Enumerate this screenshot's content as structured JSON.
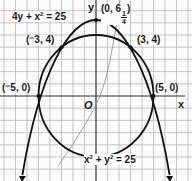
{
  "diagram": {
    "type": "coordinate-graph",
    "origin_label": "O",
    "x_axis_label": "x",
    "y_axis_label": "y",
    "grid": true,
    "curves": [
      {
        "name": "parabola",
        "equation_parts": {
          "lhs": "4y + x",
          "exp": "2",
          "rhs": " = 25"
        },
        "vertex": [
          0,
          6.25
        ]
      },
      {
        "name": "circle",
        "equation_parts": {
          "a": "x",
          "a_exp": "2",
          "mid": " + y",
          "b_exp": "2",
          "rhs": " = 25"
        },
        "center": [
          0,
          0
        ],
        "radius": 5
      }
    ],
    "points": [
      {
        "label": "(⁻5, 0)",
        "x": -5,
        "y": 0
      },
      {
        "label": "(⁻3, 4)",
        "x": -3,
        "y": 4
      },
      {
        "label": "(3, 4)",
        "x": 3,
        "y": 4
      },
      {
        "label": "(5, 0)",
        "x": 5,
        "y": 0
      },
      {
        "label_prefix": "(0, 6",
        "label_num": "1",
        "label_den": "4",
        "label_suffix": ")",
        "x": 0,
        "y": 6.25
      }
    ]
  }
}
